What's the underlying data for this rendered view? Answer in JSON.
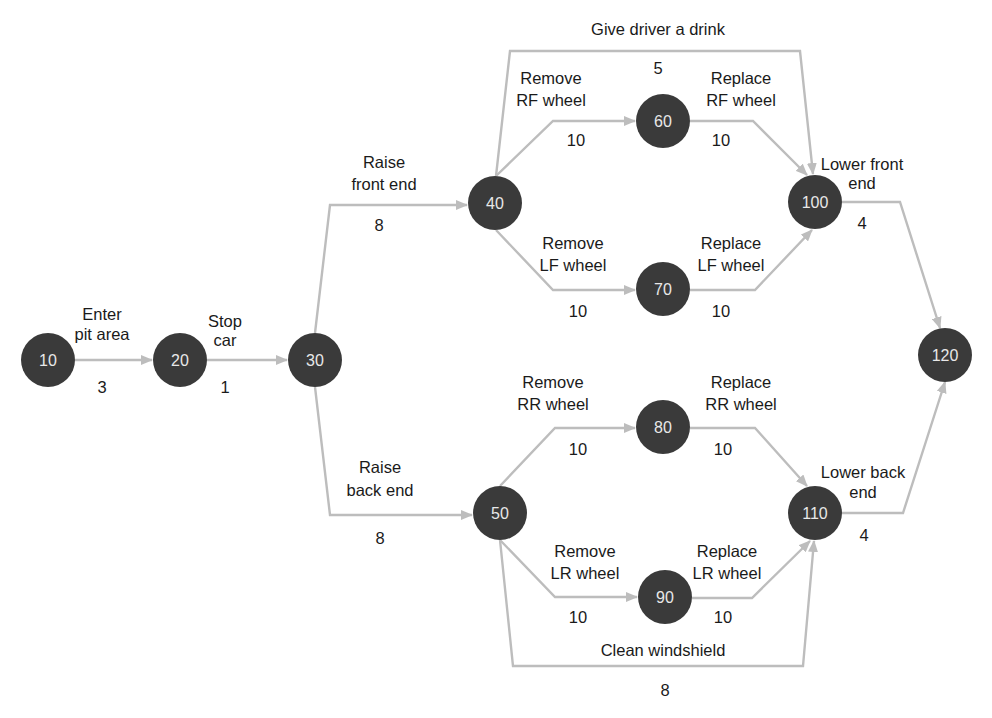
{
  "diagram": {
    "type": "activity-on-arrow network",
    "colors": {
      "node_fill": "#3a3a3a",
      "node_text": "#e8e8e8",
      "edge": "#bdbdbd",
      "text": "#1a1a1a",
      "background": "#ffffff"
    },
    "nodes": [
      {
        "id": "10",
        "label": "10",
        "x": 48,
        "y": 360
      },
      {
        "id": "20",
        "label": "20",
        "x": 180,
        "y": 360
      },
      {
        "id": "30",
        "label": "30",
        "x": 315,
        "y": 360
      },
      {
        "id": "40",
        "label": "40",
        "x": 495,
        "y": 203
      },
      {
        "id": "50",
        "label": "50",
        "x": 500,
        "y": 513
      },
      {
        "id": "60",
        "label": "60",
        "x": 663,
        "y": 121
      },
      {
        "id": "70",
        "label": "70",
        "x": 663,
        "y": 289
      },
      {
        "id": "80",
        "label": "80",
        "x": 663,
        "y": 427
      },
      {
        "id": "90",
        "label": "90",
        "x": 665,
        "y": 597
      },
      {
        "id": "100",
        "label": "100",
        "x": 815,
        "y": 202
      },
      {
        "id": "110",
        "label": "110",
        "x": 815,
        "y": 513
      },
      {
        "id": "120",
        "label": "120",
        "x": 945,
        "y": 355
      }
    ],
    "activities": [
      {
        "from": "10",
        "to": "20",
        "name_lines": [
          "Enter",
          "pit area"
        ],
        "duration": "3"
      },
      {
        "from": "20",
        "to": "30",
        "name_lines": [
          "Stop",
          "car"
        ],
        "duration": "1"
      },
      {
        "from": "30",
        "to": "40",
        "name_lines": [
          "Raise",
          "front end"
        ],
        "duration": "8"
      },
      {
        "from": "30",
        "to": "50",
        "name_lines": [
          "Raise",
          "back end"
        ],
        "duration": "8"
      },
      {
        "from": "40",
        "to": "60",
        "name_lines": [
          "Remove",
          "RF wheel"
        ],
        "duration": "10"
      },
      {
        "from": "40",
        "to": "70",
        "name_lines": [
          "Remove",
          "LF wheel"
        ],
        "duration": "10"
      },
      {
        "from": "40",
        "to": "100",
        "name_lines": [
          "Give driver a drink"
        ],
        "duration": "5"
      },
      {
        "from": "60",
        "to": "100",
        "name_lines": [
          "Replace",
          "RF wheel"
        ],
        "duration": "10"
      },
      {
        "from": "70",
        "to": "100",
        "name_lines": [
          "Replace",
          "LF wheel"
        ],
        "duration": "10"
      },
      {
        "from": "50",
        "to": "80",
        "name_lines": [
          "Remove",
          "RR wheel"
        ],
        "duration": "10"
      },
      {
        "from": "50",
        "to": "90",
        "name_lines": [
          "Remove",
          "LR wheel"
        ],
        "duration": "10"
      },
      {
        "from": "50",
        "to": "110",
        "name_lines": [
          "Clean windshield"
        ],
        "duration": "8"
      },
      {
        "from": "80",
        "to": "110",
        "name_lines": [
          "Replace",
          "RR wheel"
        ],
        "duration": "10"
      },
      {
        "from": "90",
        "to": "110",
        "name_lines": [
          "Replace",
          "LR wheel"
        ],
        "duration": "10"
      },
      {
        "from": "100",
        "to": "120",
        "name_lines": [
          "Lower front",
          "end"
        ],
        "duration": "4"
      },
      {
        "from": "110",
        "to": "120",
        "name_lines": [
          "Lower back",
          "end"
        ],
        "duration": "4"
      }
    ]
  }
}
